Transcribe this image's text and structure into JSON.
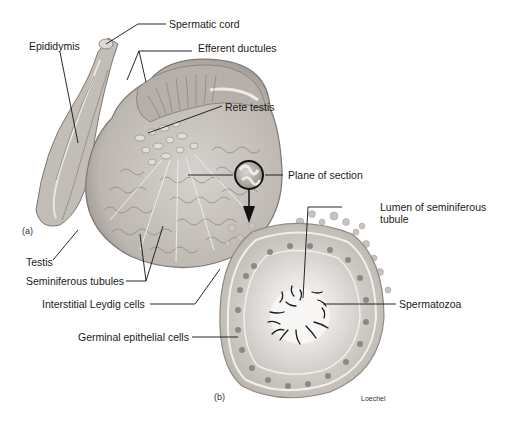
{
  "figure": {
    "panels": [
      {
        "id": "a",
        "marker": "(a)"
      },
      {
        "id": "b",
        "marker": "(b)"
      }
    ],
    "labels": {
      "spermatic_cord": "Spermatic cord",
      "epididymis": "Epididymis",
      "efferent_ductules": "Efferent ductules",
      "rete_testis": "Rete testis",
      "plane_of_section": "Plane of section",
      "lumen_line1": "Lumen of seminiferous",
      "lumen_line2": "tubule",
      "spermatozoa": "Spermatozoa",
      "testis": "Testis",
      "seminiferous_tubules": "Seminiferous tubules",
      "interstitial_leydig": "Interstitial Leydig cells",
      "germinal_epithelial": "Germinal epithelial cells"
    },
    "credit": "Loechel",
    "colors": {
      "tissue_fill": "#c9c4bf",
      "tissue_dark": "#8e8883",
      "tissue_light": "#e4e0dc",
      "leader_line": "#111111",
      "cell_nucleus": "#7d7873",
      "lumen": "#f4f2f0",
      "sperm": "#1a1a1a"
    }
  }
}
